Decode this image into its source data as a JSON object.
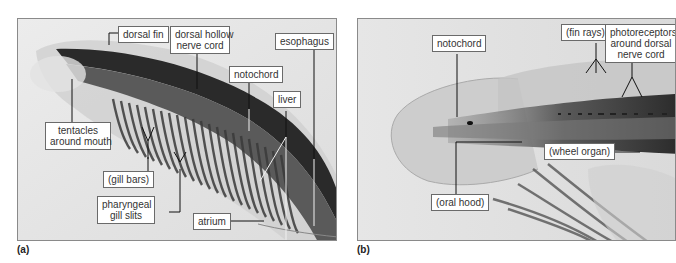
{
  "figure": {
    "panels": [
      {
        "id": "a",
        "letter": "(a)",
        "subject": "lancelet anterior body, lateral view",
        "labels": {
          "dorsal_fin": "dorsal fin",
          "dorsal_hollow_nerve_cord_1": "dorsal hollow",
          "dorsal_hollow_nerve_cord_2": "nerve cord",
          "esophagus": "esophagus",
          "notochord": "notochord",
          "liver": "liver",
          "tentacles_1": "tentacles",
          "tentacles_2": "around mouth",
          "gill_bars": "(gill bars)",
          "pharyngeal_1": "pharyngeal",
          "pharyngeal_2": "gill slits",
          "atrium": "atrium"
        }
      },
      {
        "id": "b",
        "letter": "(b)",
        "subject": "lancelet head region, close view",
        "labels": {
          "notochord": "notochord",
          "fin_rays": "(fin rays)",
          "photoreceptors_1": "photoreceptors",
          "photoreceptors_2": "around dorsal",
          "photoreceptors_3": "nerve cord",
          "wheel_organ": "(wheel organ)",
          "oral_hood": "(oral hood)"
        }
      }
    ]
  }
}
